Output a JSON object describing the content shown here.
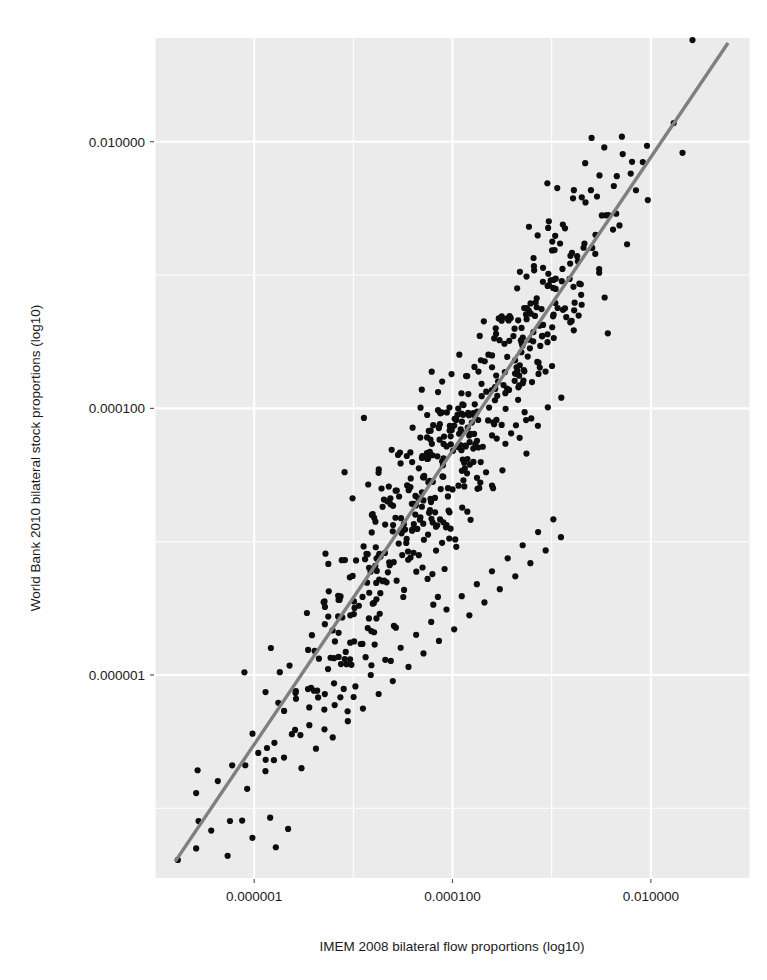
{
  "chart_data": {
    "type": "scatter",
    "title": "",
    "xlabel": "IMEM 2008 bilateral flow proportions (log10)",
    "ylabel": "World Bank 2010 bilateral stock proportions (log10)",
    "x_scale": "log10",
    "y_scale": "log10",
    "grid": true,
    "legend": "none",
    "xlim": [
      1e-07,
      0.1
    ],
    "ylim": [
      3e-08,
      0.06
    ],
    "xticks": [
      {
        "value": 1e-06,
        "label": "0.000001"
      },
      {
        "value": 0.0001,
        "label": "0.000100"
      },
      {
        "value": 0.01,
        "label": "0.010000"
      }
    ],
    "yticks": [
      {
        "value": 1e-06,
        "label": "0.000001"
      },
      {
        "value": 0.0001,
        "label": "0.000100"
      },
      {
        "value": 0.01,
        "label": "0.010000"
      }
    ],
    "fit_line": {
      "name": "linear fit (log10-log10)",
      "color": "#7f7f7f",
      "x_start": 1.6e-07,
      "x_end": 0.06,
      "y_start": 4e-08,
      "y_end": 0.055
    },
    "point_color": "#0d0d0d",
    "panel_color": "#ebebeb",
    "gridline_color": "#ffffff",
    "n_points": 560,
    "series": [
      {
        "name": "country pairs",
        "points": [
          [
            1.7e-07,
            4.1e-08
          ],
          [
            2.6e-07,
            5e-08
          ],
          [
            5.4e-07,
            4.4e-08
          ],
          [
            9.6e-07,
            6e-08
          ],
          [
            1.45e-06,
            8.5e-08
          ],
          [
            2.2e-06,
            7e-08
          ],
          [
            2.6e-07,
            1.3e-07
          ],
          [
            4.3e-07,
            1.6e-07
          ],
          [
            6e-07,
            2.1e-07
          ],
          [
            8.5e-07,
            1.4e-07
          ],
          [
            1.1e-06,
            2.6e-07
          ],
          [
            1.3e-06,
            1.9e-07
          ],
          [
            1.6e-06,
            3.1e-07
          ],
          [
            2e-06,
            2.4e-07
          ],
          [
            2.4e-06,
            3.6e-07
          ],
          [
            3e-06,
            2e-07
          ],
          [
            3.6e-06,
            4.2e-07
          ],
          [
            4.2e-06,
            2.8e-07
          ],
          [
            5.1e-06,
            5.5e-07
          ],
          [
            6.2e-06,
            3.4e-07
          ],
          [
            7.4e-06,
            6.8e-07
          ],
          [
            8.8e-06,
            4.5e-07
          ],
          [
            1.05e-05,
            8.2e-07
          ],
          [
            1.25e-05,
            5.6e-07
          ],
          [
            1.5e-05,
            1e-06
          ],
          [
            1.8e-05,
            7.2e-07
          ],
          [
            2.1e-05,
            1.3e-06
          ],
          [
            2.5e-05,
            9e-07
          ],
          [
            3e-05,
            1.6e-06
          ],
          [
            3.6e-05,
            1.15e-06
          ],
          [
            4.3e-05,
            2e-06
          ],
          [
            5.1e-05,
            1.45e-06
          ],
          [
            6.1e-05,
            2.5e-06
          ],
          [
            7.3e-05,
            1.8e-06
          ],
          [
            8.7e-05,
            3.1e-06
          ],
          [
            0.000104,
            2.2e-06
          ],
          [
            0.000124,
            3.9e-06
          ],
          [
            0.000148,
            2.8e-06
          ],
          [
            0.000176,
            4.8e-06
          ],
          [
            0.00021,
            3.5e-06
          ],
          [
            0.00025,
            6e-06
          ],
          [
            0.0003,
            4.4e-06
          ],
          [
            0.00036,
            7.5e-06
          ],
          [
            0.00043,
            5.5e-06
          ],
          [
            0.00051,
            9.4e-06
          ],
          [
            0.00061,
            6.9e-06
          ],
          [
            0.00073,
            1.18e-05
          ],
          [
            0.00087,
            8.6e-06
          ],
          [
            0.00104,
            1.47e-05
          ],
          [
            0.00124,
            1.08e-05
          ]
        ]
      }
    ],
    "note": "point coordinates are reconstructed from the rendered pixel positions; the displayed cloud is generated around the 1:1 fit with scatter matching the figure"
  },
  "axes": {
    "y_axis_title": "World Bank 2010 bilateral stock proportions (log10)",
    "x_axis_title": "IMEM 2008 bilateral flow proportions (log10)",
    "y_tick_labels": [
      "0.010000",
      "0.000100",
      "0.000001"
    ],
    "x_tick_labels": [
      "0.000001",
      "0.000100",
      "0.010000"
    ]
  },
  "style": {
    "panel_background": "#ebebeb",
    "grid_color": "#ffffff",
    "point_color": "#0d0d0d",
    "line_color": "#7f7f7f",
    "text_color": "#1a1a1a",
    "figure_background": "#ffffff"
  }
}
